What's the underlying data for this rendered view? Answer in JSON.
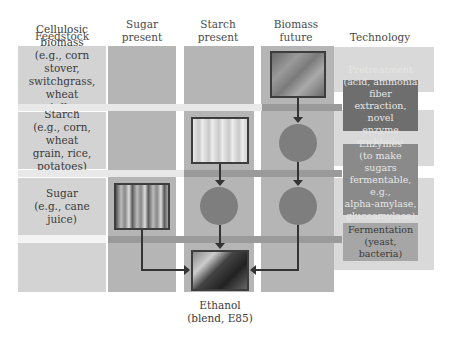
{
  "columns": {
    "feedstock": "Feedstock",
    "sugar_present": "Sugar\npresent",
    "starch_present": "Starch\npresent",
    "biomass_future": "Biomass\nfuture",
    "technology": "Technology"
  },
  "rows": [
    {
      "label": "Cellulosic biomass\n(e.g., corn stover,\nswitchgrass, wheat\nstalks, sorghum)"
    },
    {
      "label": "Starch\n(e.g., corn, wheat\ngrain, rice, potatoes)"
    },
    {
      "label": "Sugar\n(e.g., cane juice)"
    }
  ],
  "technology": [
    {
      "label": "Pretreatment\n(acid, ammonia fiber\nextraction, novel\nenzyme cocktails)"
    },
    {
      "label": "Enzymes\n(to make sugars\nfermentable, e.g.,\nalpha-amylase,\nglucoamylase)"
    },
    {
      "label": "Fermentation\n(yeast, bacteria)"
    }
  ],
  "images": {
    "biomass": "leaf-photo",
    "starch": "corn-kernels-photo",
    "sugar": "sugarcane-photo",
    "ethanol": "fuel-pump-photo"
  },
  "output": {
    "label": "Ethanol\n(blend, E85)"
  },
  "colors": {
    "row_label_bg": "#d3d3d3",
    "grid_cell": "#b3b3b3",
    "grid_cell_light": "#c4c4c4",
    "process_band": "#9a9a9a",
    "tech_box_dark": "#6e6e6e",
    "tech_box_mid": "#8a8a8a",
    "tech_box_light": "#a6a6a6",
    "circle": "#7e7e7e"
  }
}
